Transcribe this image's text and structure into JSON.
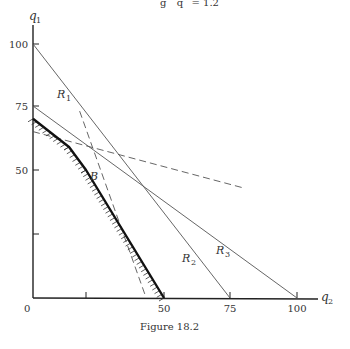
{
  "header_fragment": "g     q    = 1.2",
  "figure": {
    "caption": "Figure 18.2",
    "y_axis_label": "q",
    "y_axis_sub": "1",
    "x_axis_label": "q",
    "x_axis_sub": "2",
    "origin_label": "0",
    "y_ticks": [
      {
        "value": 25,
        "label": ""
      },
      {
        "value": 50,
        "label": "50"
      },
      {
        "value": 75,
        "label": "75"
      },
      {
        "value": 100,
        "label": "100"
      }
    ],
    "x_ticks": [
      {
        "value": 25,
        "label": ""
      },
      {
        "value": 50,
        "label": "50"
      },
      {
        "value": 75,
        "label": "75"
      },
      {
        "value": 100,
        "label": "100"
      }
    ],
    "lines": [
      {
        "name": "R1",
        "label": "R",
        "sub": "1",
        "from": {
          "q2": 0,
          "q1": 100
        },
        "to": {
          "q2": 75,
          "q1": 0
        },
        "style": "solid"
      },
      {
        "name": "R2",
        "label": "R",
        "sub": "2",
        "from": {
          "q2": 0,
          "q1": 100
        },
        "to": {
          "q2": 75,
          "q1": 0
        },
        "style": "solid"
      },
      {
        "name": "R3",
        "label": "R",
        "sub": "3",
        "from": {
          "q2": 0,
          "q1": 75
        },
        "to": {
          "q2": 100,
          "q1": 0
        },
        "style": "solid"
      }
    ],
    "dashed_lines": [
      {
        "name": "steep-dashed",
        "from": {
          "q2": 22,
          "q1": 73
        },
        "to": {
          "q2": 44,
          "q1": 1
        }
      },
      {
        "name": "shallow-dashed",
        "from": {
          "q2": 0,
          "q1": 65
        },
        "to": {
          "q2": 80,
          "q1": 43
        }
      }
    ],
    "frontier": {
      "points": [
        {
          "q2": 0,
          "q1": 70
        },
        {
          "q2": 17,
          "q1": 59
        },
        {
          "q2": 25,
          "q1": 50
        },
        {
          "q2": 50,
          "q1": 0
        }
      ],
      "hatched": true
    },
    "point_B": {
      "label": "B",
      "q2": 25,
      "q1": 50
    }
  }
}
